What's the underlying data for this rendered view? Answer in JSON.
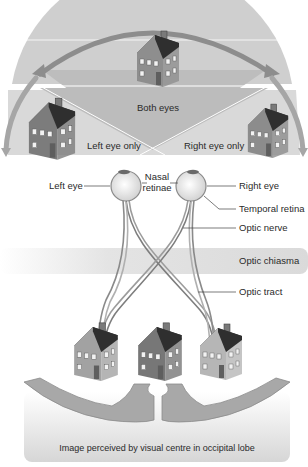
{
  "figure": {
    "colors": {
      "arc": "#9a9a9a",
      "field_both": "#c4c4c4",
      "field_side": "#dcdcdc",
      "chiasma_band": "#e2e2e2",
      "occipital_box": "#dedede",
      "cortex": "#a9a9a9",
      "house_dark": "#6d6d6d",
      "house_mid": "#8e8e8e",
      "house_light": "#b4b4b4",
      "roof": "#3e3e3e",
      "text": "#2a2a2a"
    }
  },
  "visual_fields": {
    "both": "Both eyes",
    "left_only": "Left eye only",
    "right_only": "Right eye only"
  },
  "labels": {
    "left_eye": "Left eye",
    "nasal_retinae_line1": "Nasal",
    "nasal_retinae_line2": "retinae",
    "right_eye": "Right eye",
    "temporal_retina": "Temporal retina",
    "optic_nerve": "Optic nerve",
    "optic_chiasma": "Optic chiasma",
    "optic_tract": "Optic tract",
    "occipital": "Image perceived by visual centre in occipital lobe"
  }
}
